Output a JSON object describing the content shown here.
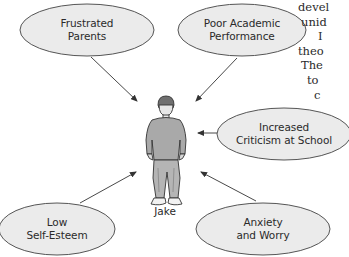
{
  "diagram": {
    "central_figure": {
      "label": "Jake",
      "icon": "person-figure"
    },
    "nodes": [
      {
        "id": "frustrated-parents",
        "lines": [
          "Frustrated",
          "Parents"
        ]
      },
      {
        "id": "poor-academic-performance",
        "lines": [
          "Poor Academic",
          "Performance"
        ]
      },
      {
        "id": "increased-criticism",
        "lines": [
          "Increased",
          "Criticism at School"
        ]
      },
      {
        "id": "low-self-esteem",
        "lines": [
          "Low",
          "Self-Esteem"
        ]
      },
      {
        "id": "anxiety-and-worry",
        "lines": [
          "Anxiety",
          "and Worry"
        ]
      }
    ],
    "arrows": [
      {
        "from": "frustrated-parents",
        "to": "Jake"
      },
      {
        "from": "poor-academic-performance",
        "to": "Jake"
      },
      {
        "from": "increased-criticism",
        "to": "Jake"
      },
      {
        "from": "low-self-esteem",
        "to": "Jake"
      },
      {
        "from": "anxiety-and-worry",
        "to": "Jake"
      }
    ],
    "colors": {
      "ellipse_fill": "#ebebeb",
      "ellipse_stroke": "#555555",
      "arrow": "#333333",
      "figure_fill": "#a9a9a9",
      "text": "#2a2a2a"
    }
  },
  "side_text": {
    "lines": [
      "devel",
      "unid",
      "I",
      "theo",
      "The",
      "to",
      "c"
    ]
  }
}
